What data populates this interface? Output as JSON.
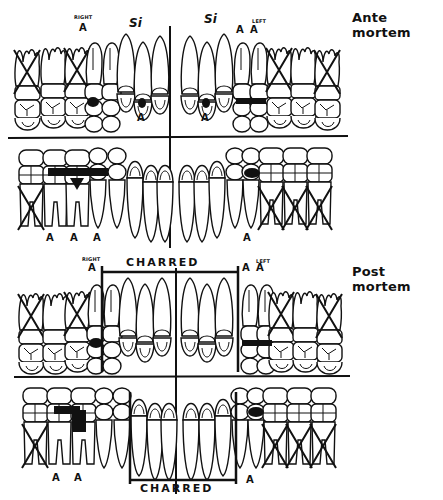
{
  "sections": [
    {
      "id": "ante",
      "title": "Ante mortem",
      "side_labels": {
        "right": "RIGHT",
        "left": "LEFT"
      },
      "si_labels": [
        "Si",
        "Si"
      ],
      "amalgam_marks": {
        "upper": [
          "A",
          "A",
          "A",
          "A",
          "A"
        ],
        "lower": [
          "A",
          "A",
          "A",
          "A"
        ]
      },
      "upper_missing_teeth": [
        1,
        3,
        14,
        16
      ],
      "lower_missing_teeth": [
        17,
        30,
        31,
        32
      ]
    },
    {
      "id": "post",
      "title": "Post mortem",
      "side_labels": {
        "right": "RIGHT",
        "left": "LEFT"
      },
      "charred_labels": [
        "CHARRED",
        "CHARRED"
      ],
      "amalgam_marks": {
        "upper": [
          "A",
          "A",
          "A"
        ],
        "lower": [
          "A",
          "A",
          "A"
        ]
      },
      "upper_missing_teeth": [
        1,
        3,
        14,
        16
      ],
      "lower_missing_teeth": [
        17,
        30,
        31,
        32
      ]
    }
  ],
  "colors": {
    "ink": "#111111",
    "paper": "#ffffff"
  }
}
